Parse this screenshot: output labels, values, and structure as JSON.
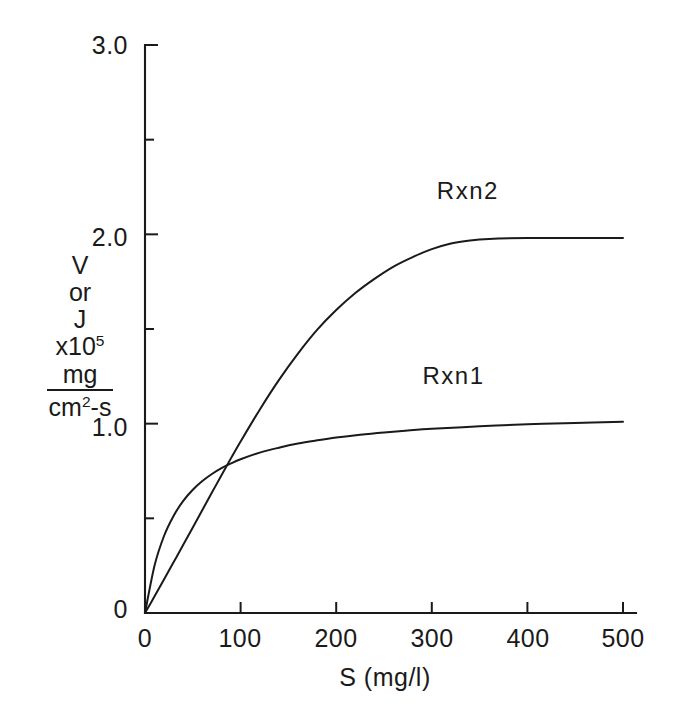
{
  "chart_data": {
    "type": "line",
    "title": "",
    "xlabel": "S (mg/l)",
    "ylabel_lines": [
      "V",
      "or",
      "J",
      "x10",
      "mg",
      "cm",
      "-s"
    ],
    "ylabel_exponent": "5",
    "ylabel_den_exponent": "2",
    "xlim": [
      0,
      500
    ],
    "ylim": [
      0,
      3.0
    ],
    "grid": false,
    "legend_position": "inline-at-curve",
    "x_ticks": [
      0,
      100,
      200,
      300,
      400,
      500
    ],
    "x_tick_labels": [
      "0",
      "100",
      "200",
      "300",
      "400",
      "500"
    ],
    "y_ticks": [
      0,
      0.5,
      1.0,
      1.5,
      2.0,
      2.5,
      3.0
    ],
    "y_tick_labels": [
      "0",
      "",
      "1.0",
      "",
      "2.0",
      "",
      "3.0"
    ],
    "y_major_ticks": [
      0,
      1.0,
      2.0,
      3.0
    ],
    "y_minor_ticks": [
      0.5,
      1.5,
      2.5
    ],
    "series": [
      {
        "name": "Rxn1",
        "model": "michaelis-menten",
        "vmax": 1.08,
        "km": 33,
        "label": "Rxn1",
        "label_x": 330,
        "label_y": 1.24,
        "x": [
          0,
          10,
          20,
          30,
          40,
          50,
          60,
          70,
          80,
          90,
          100,
          120,
          140,
          160,
          180,
          200,
          225,
          250,
          275,
          300,
          350,
          400,
          450,
          500
        ],
        "y": [
          0.0,
          0.251,
          0.408,
          0.514,
          0.592,
          0.651,
          0.697,
          0.734,
          0.765,
          0.79,
          0.812,
          0.847,
          0.873,
          0.895,
          0.912,
          0.927,
          0.942,
          0.954,
          0.964,
          0.973,
          0.986,
          0.997,
          1.004,
          1.01
        ]
      },
      {
        "name": "Rxn2",
        "model": "sigmoidal-saturating",
        "vmax": 1.98,
        "label": "Rxn2",
        "label_x": 345,
        "label_y": 2.22,
        "x": [
          0,
          10,
          20,
          30,
          40,
          50,
          60,
          70,
          80,
          90,
          100,
          120,
          140,
          160,
          180,
          200,
          220,
          240,
          260,
          280,
          300,
          320,
          340,
          360,
          400,
          450,
          500
        ],
        "y": [
          0.0,
          0.088,
          0.178,
          0.269,
          0.36,
          0.452,
          0.544,
          0.636,
          0.728,
          0.818,
          0.906,
          1.074,
          1.23,
          1.37,
          1.495,
          1.6,
          1.69,
          1.765,
          1.83,
          1.88,
          1.922,
          1.952,
          1.968,
          1.976,
          1.98,
          1.98,
          1.98
        ]
      }
    ],
    "axis_color": "#1a1a1a",
    "curve_color": "#1a1a1a",
    "background_color": "#ffffff"
  }
}
